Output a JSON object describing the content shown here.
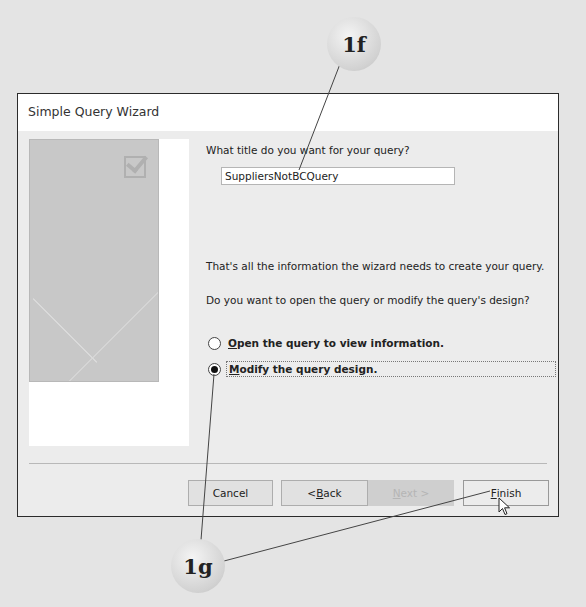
{
  "dialog": {
    "title": "Simple Query Wizard",
    "prompt_title": "What title do you want for your query?",
    "query_title_value": "SuppliersNotBCQuery",
    "info_text": "That's all the information the wizard needs to create your query.",
    "choice_prompt": "Do you want to open the query or modify the query's design?",
    "options": [
      {
        "accel": "O",
        "rest": "pen the query to view information.",
        "selected": false
      },
      {
        "accel": "M",
        "rest": "odify the query design.",
        "selected": true
      }
    ],
    "buttons": {
      "cancel": "Cancel",
      "back_prefix": "< ",
      "back_accel": "B",
      "back_rest": "ack",
      "next_accel": "N",
      "next_rest": "ext >",
      "finish_accel": "F",
      "finish_rest": "inish"
    }
  },
  "callouts": {
    "step_f": "1f",
    "step_g": "1g"
  },
  "colors": {
    "background": "#e4e4e4",
    "dialog_bg": "#ececec",
    "border": "#2b2b2b"
  }
}
